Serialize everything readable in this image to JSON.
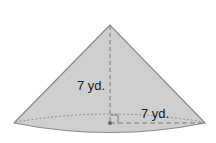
{
  "figure": {
    "shape": "cone",
    "height_label": "7 yd.",
    "radius_label": "7 yd.",
    "colors": {
      "fill": "#cfcfcf",
      "outline": "#8a8a8a",
      "dashed": "#7a7a7a",
      "dotted": "#9a9a9a",
      "center_dot": "#666666",
      "text": "#1a1a1a"
    }
  }
}
